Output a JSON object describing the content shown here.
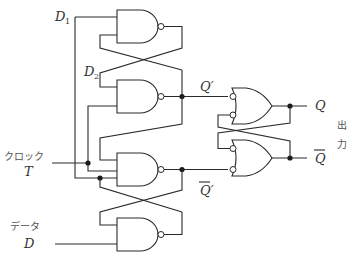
{
  "diagram": {
    "title": "",
    "type": "master-slave D flip-flop (NAND / inverted-input OR gates)",
    "labels": {
      "d1": "D",
      "d1_sub": "1",
      "d2": "D",
      "d2_sub": "2",
      "clock_jp": "クロック",
      "clock": "T",
      "data_jp": "データ",
      "data": "D",
      "q_prime": "Q′",
      "qbar_prime": "Q′",
      "q": "Q",
      "qbar": "Q",
      "output_jp_1": "出",
      "output_jp_2": "力"
    },
    "gates": [
      {
        "id": "nand-1",
        "kind": "NAND"
      },
      {
        "id": "nand-2",
        "kind": "NAND"
      },
      {
        "id": "nand-3",
        "kind": "NAND"
      },
      {
        "id": "nand-4",
        "kind": "NAND"
      },
      {
        "id": "or-inv-top",
        "kind": "OR with inverted inputs"
      },
      {
        "id": "or-inv-bottom",
        "kind": "OR with inverted inputs"
      }
    ],
    "colors": {
      "line": "#2a2a2a",
      "text": "#333333",
      "background": "#ffffff"
    }
  }
}
